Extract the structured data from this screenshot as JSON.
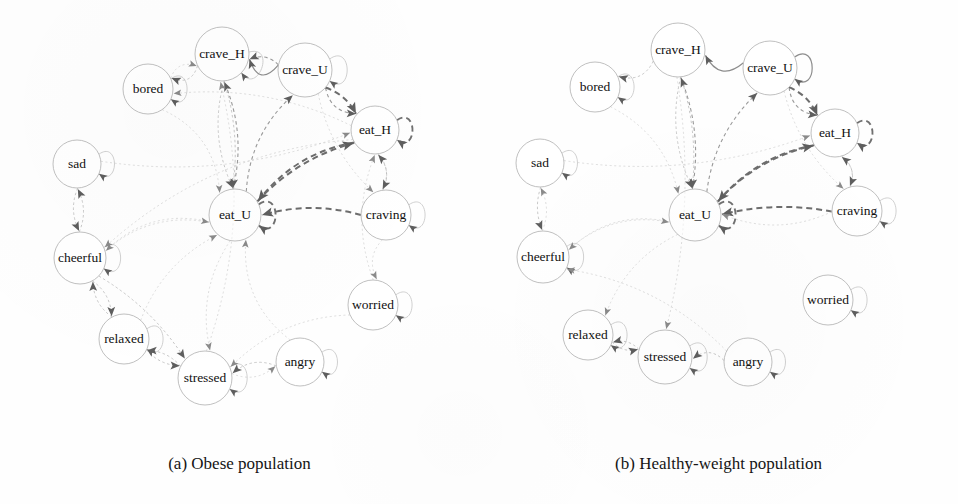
{
  "figure": {
    "kind": "state-transition-diagram-pair",
    "panels": [
      {
        "id": "a",
        "caption": "(a) Obese population",
        "nodes": [
          {
            "id": "crave_H",
            "label": "crave_H",
            "x": 222,
            "y": 54,
            "r": 27
          },
          {
            "id": "crave_U",
            "label": "crave_U",
            "x": 305,
            "y": 70,
            "r": 27
          },
          {
            "id": "bored",
            "label": "bored",
            "x": 148,
            "y": 89,
            "r": 25
          },
          {
            "id": "eat_H",
            "label": "eat_H",
            "x": 375,
            "y": 130,
            "r": 24
          },
          {
            "id": "sad",
            "label": "sad",
            "x": 77,
            "y": 164,
            "r": 24
          },
          {
            "id": "eat_U",
            "label": "eat_U",
            "x": 235,
            "y": 215,
            "r": 26
          },
          {
            "id": "craving",
            "label": "craving",
            "x": 386,
            "y": 215,
            "r": 25
          },
          {
            "id": "cheerful",
            "label": "cheerful",
            "x": 80,
            "y": 258,
            "r": 26
          },
          {
            "id": "worried",
            "label": "worried",
            "x": 373,
            "y": 305,
            "r": 25
          },
          {
            "id": "relaxed",
            "label": "relaxed",
            "x": 124,
            "y": 339,
            "r": 25
          },
          {
            "id": "stressed",
            "label": "stressed",
            "x": 205,
            "y": 378,
            "r": 27
          },
          {
            "id": "angry",
            "label": "angry",
            "x": 300,
            "y": 362,
            "r": 24
          }
        ],
        "self_loops": [
          {
            "node": "crave_H",
            "weight": "light",
            "dir": 20
          },
          {
            "node": "crave_U",
            "weight": "light",
            "dir": 0
          },
          {
            "node": "bored",
            "weight": "light",
            "dir": 0
          },
          {
            "node": "eat_H",
            "weight": "strong",
            "dir": 0
          },
          {
            "node": "sad",
            "weight": "light",
            "dir": 0
          },
          {
            "node": "eat_U",
            "weight": "strong",
            "dir": 0
          },
          {
            "node": "craving",
            "weight": "light",
            "dir": 0
          },
          {
            "node": "cheerful",
            "weight": "light",
            "dir": 0
          },
          {
            "node": "worried",
            "weight": "light",
            "dir": 0
          },
          {
            "node": "relaxed",
            "weight": "light",
            "dir": 0
          },
          {
            "node": "stressed",
            "weight": "light",
            "dir": 0
          },
          {
            "node": "angry",
            "weight": "light",
            "dir": 0
          }
        ],
        "edges": [
          {
            "from": "crave_U",
            "to": "crave_H",
            "weight": "solid",
            "curve": -26
          },
          {
            "from": "crave_U",
            "to": "crave_H",
            "weight": "mid",
            "curve": 10
          },
          {
            "from": "crave_H",
            "to": "bored",
            "weight": "light",
            "curve": -16
          },
          {
            "from": "eat_H",
            "to": "bored",
            "weight": "faint",
            "curve": 26
          },
          {
            "from": "crave_U",
            "to": "eat_H",
            "weight": "mid",
            "curve": 16
          },
          {
            "from": "crave_U",
            "to": "eat_H",
            "weight": "strong",
            "curve": -8
          },
          {
            "from": "eat_H",
            "to": "eat_U",
            "weight": "strong",
            "curve": 22
          },
          {
            "from": "eat_U",
            "to": "eat_H",
            "weight": "strong",
            "curve": -16
          },
          {
            "from": "eat_U",
            "to": "crave_H",
            "weight": "mid",
            "curve": 18
          },
          {
            "from": "crave_H",
            "to": "eat_U",
            "weight": "light",
            "curve": 20
          },
          {
            "from": "crave_H",
            "to": "eat_U",
            "weight": "light",
            "curve": -12
          },
          {
            "from": "eat_U",
            "to": "crave_U",
            "weight": "mid",
            "curve": -22
          },
          {
            "from": "craving",
            "to": "eat_H",
            "weight": "light",
            "curve": 12
          },
          {
            "from": "eat_H",
            "to": "craving",
            "weight": "light",
            "curve": -12
          },
          {
            "from": "craving",
            "to": "eat_U",
            "weight": "strong",
            "curve": 14
          },
          {
            "from": "sad",
            "to": "cheerful",
            "weight": "light",
            "curve": 10
          },
          {
            "from": "cheerful",
            "to": "sad",
            "weight": "light",
            "curve": 10
          },
          {
            "from": "cheerful",
            "to": "relaxed",
            "weight": "light",
            "curve": -10
          },
          {
            "from": "relaxed",
            "to": "cheerful",
            "weight": "light",
            "curve": -10
          },
          {
            "from": "cheerful",
            "to": "stressed",
            "weight": "light",
            "curve": -14
          },
          {
            "from": "relaxed",
            "to": "stressed",
            "weight": "light",
            "curve": 8
          },
          {
            "from": "stressed",
            "to": "relaxed",
            "weight": "light",
            "curve": 8
          },
          {
            "from": "angry",
            "to": "stressed",
            "weight": "light",
            "curve": 14
          },
          {
            "from": "stressed",
            "to": "angry",
            "weight": "faint",
            "curve": 14
          },
          {
            "from": "eat_U",
            "to": "cheerful",
            "weight": "faint",
            "curve": 30
          },
          {
            "from": "cheerful",
            "to": "eat_U",
            "weight": "faint",
            "curve": -26
          },
          {
            "from": "eat_U",
            "to": "stressed",
            "weight": "faint",
            "curve": 24
          },
          {
            "from": "bored",
            "to": "eat_U",
            "weight": "faint",
            "curve": -30
          },
          {
            "from": "sad",
            "to": "eat_H",
            "weight": "faint",
            "curve": 34
          },
          {
            "from": "craving",
            "to": "worried",
            "weight": "faint",
            "curve": 14
          },
          {
            "from": "worried",
            "to": "stressed",
            "weight": "faint",
            "curve": 26
          },
          {
            "from": "angry",
            "to": "eat_U",
            "weight": "faint",
            "curve": -30
          },
          {
            "from": "relaxed",
            "to": "eat_U",
            "weight": "faint",
            "curve": -22
          },
          {
            "from": "eat_H",
            "to": "cheerful",
            "weight": "faint",
            "curve": 46
          },
          {
            "from": "crave_U",
            "to": "craving",
            "weight": "faint",
            "curve": 18
          },
          {
            "from": "bored",
            "to": "crave_H",
            "weight": "faint",
            "curve": -14
          },
          {
            "from": "stressed",
            "to": "crave_H",
            "weight": "faint",
            "curve": 40
          },
          {
            "from": "worried",
            "to": "eat_H",
            "weight": "faint",
            "curve": -24
          }
        ]
      },
      {
        "id": "b",
        "caption": "(b) Healthy-weight population",
        "nodes": [
          {
            "id": "crave_H",
            "label": "crave_H",
            "x": 199,
            "y": 50,
            "r": 27
          },
          {
            "id": "crave_U",
            "label": "crave_U",
            "x": 291,
            "y": 68,
            "r": 27
          },
          {
            "id": "bored",
            "label": "bored",
            "x": 116,
            "y": 87,
            "r": 25
          },
          {
            "id": "eat_H",
            "label": "eat_H",
            "x": 356,
            "y": 133,
            "r": 24
          },
          {
            "id": "sad",
            "label": "sad",
            "x": 61,
            "y": 163,
            "r": 24
          },
          {
            "id": "eat_U",
            "label": "eat_U",
            "x": 216,
            "y": 215,
            "r": 26
          },
          {
            "id": "craving",
            "label": "craving",
            "x": 378,
            "y": 211,
            "r": 25
          },
          {
            "id": "cheerful",
            "label": "cheerful",
            "x": 64,
            "y": 257,
            "r": 26
          },
          {
            "id": "worried",
            "label": "worried",
            "x": 349,
            "y": 300,
            "r": 25
          },
          {
            "id": "relaxed",
            "label": "relaxed",
            "x": 109,
            "y": 335,
            "r": 25
          },
          {
            "id": "stressed",
            "label": "stressed",
            "x": 186,
            "y": 357,
            "r": 27
          },
          {
            "id": "angry",
            "label": "angry",
            "x": 269,
            "y": 362,
            "r": 24
          }
        ],
        "self_loops": [
          {
            "node": "crave_U",
            "weight": "solid",
            "dir": 0
          },
          {
            "node": "bored",
            "weight": "light",
            "dir": 0
          },
          {
            "node": "eat_H",
            "weight": "strong",
            "dir": 0
          },
          {
            "node": "sad",
            "weight": "light",
            "dir": 0
          },
          {
            "node": "eat_U",
            "weight": "strong",
            "dir": 0
          },
          {
            "node": "craving",
            "weight": "light",
            "dir": 0
          },
          {
            "node": "cheerful",
            "weight": "light",
            "dir": 0
          },
          {
            "node": "worried",
            "weight": "light",
            "dir": 0
          },
          {
            "node": "relaxed",
            "weight": "light",
            "dir": 0
          },
          {
            "node": "stressed",
            "weight": "light",
            "dir": 0
          },
          {
            "node": "angry",
            "weight": "light",
            "dir": 0
          }
        ],
        "edges": [
          {
            "from": "crave_U",
            "to": "crave_H",
            "weight": "solid",
            "curve": -24
          },
          {
            "from": "crave_H",
            "to": "bored",
            "weight": "light",
            "curve": -16
          },
          {
            "from": "crave_U",
            "to": "eat_H",
            "weight": "mid",
            "curve": 16
          },
          {
            "from": "crave_U",
            "to": "eat_H",
            "weight": "strong",
            "curve": -8
          },
          {
            "from": "eat_U",
            "to": "eat_H",
            "weight": "strong",
            "curve": -18
          },
          {
            "from": "eat_H",
            "to": "eat_U",
            "weight": "strong",
            "curve": 20
          },
          {
            "from": "eat_U",
            "to": "crave_H",
            "weight": "mid",
            "curve": 16
          },
          {
            "from": "crave_H",
            "to": "eat_U",
            "weight": "light",
            "curve": 20
          },
          {
            "from": "crave_H",
            "to": "eat_U",
            "weight": "light",
            "curve": -12
          },
          {
            "from": "eat_U",
            "to": "crave_U",
            "weight": "mid",
            "curve": -20
          },
          {
            "from": "craving",
            "to": "eat_H",
            "weight": "light",
            "curve": 12
          },
          {
            "from": "eat_H",
            "to": "craving",
            "weight": "light",
            "curve": -12
          },
          {
            "from": "craving",
            "to": "eat_U",
            "weight": "strong",
            "curve": 12
          },
          {
            "from": "sad",
            "to": "cheerful",
            "weight": "light",
            "curve": 8
          },
          {
            "from": "cheerful",
            "to": "sad",
            "weight": "faint",
            "curve": 10
          },
          {
            "from": "relaxed",
            "to": "stressed",
            "weight": "light",
            "curve": 8
          },
          {
            "from": "stressed",
            "to": "relaxed",
            "weight": "light",
            "curve": 8
          },
          {
            "from": "angry",
            "to": "stressed",
            "weight": "light",
            "curve": 14
          },
          {
            "from": "cheerful",
            "to": "eat_U",
            "weight": "faint",
            "curve": -26
          },
          {
            "from": "eat_U",
            "to": "cheerful",
            "weight": "faint",
            "curve": 28
          },
          {
            "from": "bored",
            "to": "eat_U",
            "weight": "faint",
            "curve": -26
          },
          {
            "from": "sad",
            "to": "eat_H",
            "weight": "faint",
            "curve": 32
          },
          {
            "from": "crave_U",
            "to": "craving",
            "weight": "faint",
            "curve": 18
          },
          {
            "from": "crave_H",
            "to": "stressed",
            "weight": "faint",
            "curve": -26
          },
          {
            "from": "angry",
            "to": "cheerful",
            "weight": "faint",
            "curve": 30
          },
          {
            "from": "eat_U",
            "to": "relaxed",
            "weight": "faint",
            "curve": 22
          },
          {
            "from": "craving",
            "to": "eat_U",
            "weight": "faint",
            "curve": -24
          }
        ]
      }
    ]
  }
}
